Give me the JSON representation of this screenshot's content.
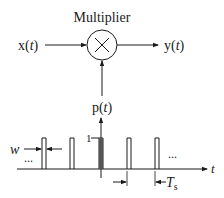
{
  "diagram": {
    "title": "Multiplier",
    "input_label_base": "x(",
    "input_label_var": "t",
    "input_label_end": ")",
    "output_label_base": "y(",
    "output_label_var": "t",
    "output_label_end": ")",
    "multiplier_symbol": "×",
    "pulse_label_base": "p(",
    "pulse_label_var": "t",
    "pulse_label_end": ")",
    "amplitude_label": "1",
    "width_label": "w",
    "ellipsis_left": "...",
    "ellipsis_right": "...",
    "time_axis_label": "t",
    "period_label_base": "T",
    "period_label_sub": "s",
    "colors": {
      "stroke": "#1a1a1a",
      "background": "#ffffff"
    },
    "pulse_train": {
      "pulse_left_edges_px": [
        42,
        70,
        99,
        127,
        155
      ],
      "pulse_width_px": 4,
      "top_y_px": 138,
      "baseline_y_px": 169
    }
  }
}
